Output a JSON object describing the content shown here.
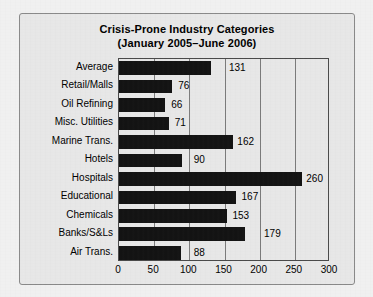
{
  "chart_data": {
    "type": "bar",
    "orientation": "horizontal",
    "title": "Crisis-Prone Industry Categories",
    "subtitle": "(January 2005–June 2006)",
    "xlabel": "",
    "ylabel": "",
    "xlim": [
      0,
      300
    ],
    "xticks": [
      0,
      50,
      100,
      150,
      200,
      250,
      300
    ],
    "xtick_labels": [
      "0",
      "50",
      "100",
      "150",
      "200",
      "250",
      "300"
    ],
    "grid": "vertical",
    "legend": "none",
    "bar_color": "#131313",
    "categories": [
      "Average",
      "Retail/Malls",
      "Oil Refining",
      "Misc. Utilities",
      "Marine Trans.",
      "Hotels",
      "Hospitals",
      "Educational",
      "Chemicals",
      "Banks/S&Ls",
      "Air Trans."
    ],
    "values": [
      131,
      76,
      66,
      71,
      162,
      90,
      260,
      167,
      153,
      179,
      88
    ],
    "value_labels": [
      "131",
      "76",
      "66",
      "71",
      "162",
      "90",
      "260",
      "167",
      "153",
      "179",
      "88"
    ],
    "label_anchor_units": [
      152,
      80,
      70,
      75,
      164,
      102,
      262,
      170,
      157,
      202,
      102
    ]
  },
  "colors": {
    "background": "#e9e9e9",
    "page": "#f2f2f2",
    "frame_border": "#8a8a8a",
    "axis": "#4a4a4a",
    "gridline": "#7d7d7d",
    "bar": "#131313",
    "text": "#000000"
  }
}
